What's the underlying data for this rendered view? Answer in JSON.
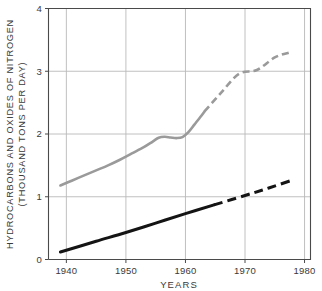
{
  "chart_data": {
    "type": "line",
    "title": "",
    "xlabel": "YEARS",
    "ylabel_line1": "HYDROCARBONS AND OXIDES OF NITROGEN",
    "ylabel_line2": "(THOUSAND TONS PER DAY)",
    "xlim": [
      1937,
      1981
    ],
    "ylim": [
      0,
      4
    ],
    "xticks": [
      1940,
      1950,
      1960,
      1970,
      1980
    ],
    "xtick_labels": [
      "1940",
      "1950",
      "1960",
      "1970",
      "1980"
    ],
    "yticks": [
      0,
      1,
      2,
      3,
      4
    ],
    "ytick_labels": [
      "0",
      "1",
      "2",
      "3",
      "4"
    ],
    "grid": true,
    "grid_color": "#b9b9b9",
    "axis_color": "#4a4a4a",
    "legend": "none",
    "series": [
      {
        "name": "hydrocarbons-and-oxides-of-nitrogen-upper",
        "color": "#9a9a9a",
        "line_width": 2.6,
        "solid_points": [
          [
            1939.0,
            1.18
          ],
          [
            1941.0,
            1.26
          ],
          [
            1943.0,
            1.34
          ],
          [
            1945.0,
            1.42
          ],
          [
            1947.0,
            1.5
          ],
          [
            1949.0,
            1.59
          ],
          [
            1951.0,
            1.69
          ],
          [
            1953.0,
            1.79
          ],
          [
            1954.5,
            1.88
          ],
          [
            1955.5,
            1.94
          ],
          [
            1956.5,
            1.955
          ],
          [
            1957.5,
            1.945
          ],
          [
            1958.5,
            1.935
          ],
          [
            1959.5,
            1.95
          ],
          [
            1960.5,
            2.03
          ],
          [
            1961.5,
            2.15
          ],
          [
            1962.5,
            2.27
          ],
          [
            1963.2,
            2.36
          ]
        ],
        "dashed_points": [
          [
            1963.2,
            2.36
          ],
          [
            1966.0,
            2.66
          ],
          [
            1969.0,
            2.96
          ],
          [
            1972.0,
            3.02
          ],
          [
            1975.0,
            3.22
          ],
          [
            1977.5,
            3.3
          ]
        ],
        "dash_pattern": "7,4"
      },
      {
        "name": "hydrocarbons-lower",
        "color": "#141414",
        "line_width": 3.0,
        "solid_points": [
          [
            1939.0,
            0.12
          ],
          [
            1945.0,
            0.29
          ],
          [
            1950.0,
            0.43
          ],
          [
            1955.0,
            0.58
          ],
          [
            1960.0,
            0.73
          ],
          [
            1964.8,
            0.87
          ]
        ],
        "dashed_points": [
          [
            1964.8,
            0.87
          ],
          [
            1970.0,
            1.02
          ],
          [
            1974.0,
            1.14
          ],
          [
            1977.8,
            1.26
          ]
        ],
        "dash_pattern": "9,5"
      }
    ]
  }
}
